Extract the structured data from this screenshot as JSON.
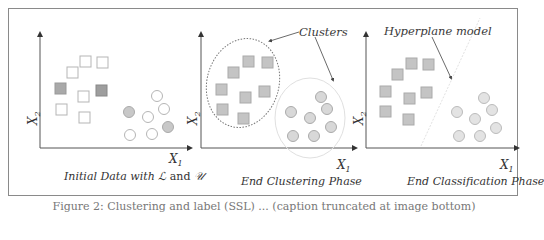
{
  "figure": {
    "caption": "Figure 2: Clustering and label (SSL) ... (caption truncated at image bottom)",
    "panels": [
      {
        "id": "initial",
        "title_prefix": "Initial Data with ",
        "title_L": "ℒ",
        "title_and": " and ",
        "title_U": "𝒰",
        "x_axis": "X",
        "x_sub": "1",
        "y_axis": "X",
        "y_sub": "2"
      },
      {
        "id": "clustering",
        "title": "End Clustering Phase",
        "annotation": "Clusters",
        "x_axis": "X",
        "x_sub": "1",
        "y_axis": "X",
        "y_sub": "2"
      },
      {
        "id": "classification",
        "title": "End Classification Phase",
        "annotation": "Hyperplane model",
        "x_axis": "X",
        "x_sub": "1",
        "y_axis": "X",
        "y_sub": "2"
      }
    ],
    "legend_semantics": {
      "square": "class A samples",
      "circle": "class B samples",
      "filled": "labeled (L)",
      "hollow": "unlabeled (U)"
    },
    "colors": {
      "frame": "#8a8a8a",
      "axis": "#555555",
      "labeled_fill": "#a9a9a9",
      "cluster_fill": "#c4c4c4",
      "hollow_stroke": "#b5b5b5",
      "circle_fill": "#d8d8d8"
    }
  }
}
